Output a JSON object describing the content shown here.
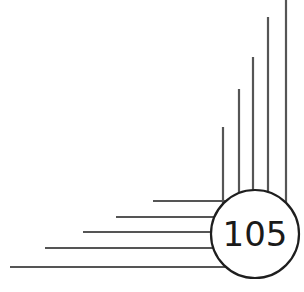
{
  "badge": {
    "number": "105",
    "color": "#1e1e1e",
    "line_color": "#555555"
  },
  "vertical_lines": [
    {
      "x": 223,
      "top": 127
    },
    {
      "x": 239,
      "top": 89
    },
    {
      "x": 253,
      "top": 57
    },
    {
      "x": 268,
      "top": 17
    },
    {
      "x": 286,
      "top": 0
    }
  ],
  "horizontal_lines": [
    {
      "y": 201,
      "left": 153
    },
    {
      "y": 217,
      "left": 116
    },
    {
      "y": 232,
      "left": 83
    },
    {
      "y": 248,
      "left": 45
    },
    {
      "y": 267,
      "left": 10
    }
  ]
}
